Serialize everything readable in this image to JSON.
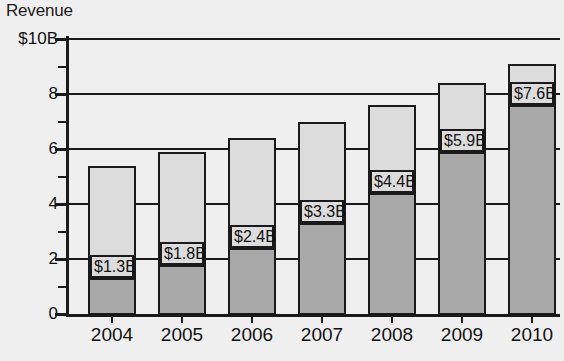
{
  "chart_data": {
    "type": "bar",
    "stacked": true,
    "title": "Revenue",
    "xlabel": "",
    "ylabel": "Revenue",
    "ylim": [
      0,
      10
    ],
    "yunit": "$B",
    "grid": true,
    "legend": "none",
    "categories": [
      "2004",
      "2005",
      "2006",
      "2007",
      "2008",
      "2009",
      "2010"
    ],
    "y_tick_labels": [
      "$10B",
      "8",
      "6",
      "4",
      "2",
      "0"
    ],
    "y_tick_values": [
      10,
      8,
      6,
      4,
      2,
      0
    ],
    "y_minor_ticks": [
      9,
      7,
      5,
      3,
      1
    ],
    "series": [
      {
        "name": "lower-segment",
        "color": "#a8a8a8",
        "values": [
          1.3,
          1.8,
          2.4,
          3.3,
          4.4,
          5.9,
          7.6
        ],
        "labels": [
          "$1.3B",
          "$1.8B",
          "$2.4B",
          "$3.3B",
          "$4.4B",
          "$5.9B",
          "$7.6B"
        ]
      },
      {
        "name": "upper-segment",
        "color": "#dcdcdc",
        "values": [
          4.1,
          4.1,
          4.0,
          3.7,
          3.2,
          2.5,
          1.5
        ]
      }
    ],
    "totals": [
      5.4,
      5.9,
      6.4,
      7.0,
      7.6,
      8.4,
      9.1
    ]
  },
  "axis": {
    "title": "Revenue"
  }
}
